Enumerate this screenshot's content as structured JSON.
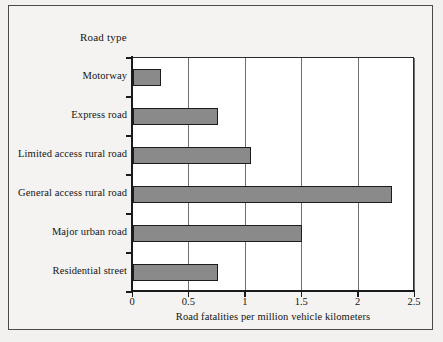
{
  "figure": {
    "title": "Road type",
    "background_color": "#f2f1ef",
    "plot_background_color": "#ffffff",
    "frame_color": "#4a4a4a"
  },
  "chart_data": {
    "type": "bar",
    "orientation": "horizontal",
    "title": "Road type",
    "xlabel": "Road fatalities per million vehicle kilometers",
    "ylabel": "Road type",
    "xlim": [
      0,
      2.5
    ],
    "xticks": [
      0,
      0.5,
      1,
      1.5,
      2,
      2.5
    ],
    "xtick_labels": [
      "0",
      "0.5",
      "1",
      "1.5",
      "2",
      "2.5"
    ],
    "grid": "vertical",
    "legend": "none",
    "bar_color": "#8a8a8a",
    "bar_edge_color": "#1c1c1c",
    "categories": [
      "Motorway",
      "Express road",
      "Limited access rural road",
      "General access rural road",
      "Major urban road",
      "Residential street"
    ],
    "values": [
      0.25,
      0.75,
      1.05,
      2.3,
      1.5,
      0.75
    ]
  }
}
